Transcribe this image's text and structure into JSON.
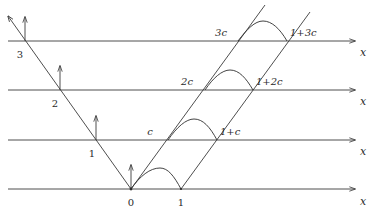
{
  "diagram": {
    "type": "space-time characteristics diagram",
    "colors": {
      "stroke": "#3a3a3a",
      "text": "#2a2a2a",
      "background": "#ffffff"
    },
    "time_lines": [
      {
        "index": 0,
        "y": 189,
        "left_label": "0",
        "left_label_pos": [
          131,
          205
        ],
        "axis_label": "x"
      },
      {
        "index": 1,
        "y": 140,
        "left_label": "1",
        "left_label_pos": [
          92,
          157
        ],
        "axis_label": "x",
        "c_label": "c",
        "c_label_pos": [
          150,
          135
        ],
        "right_label": "1+c",
        "right_label_pos": [
          221,
          135
        ]
      },
      {
        "index": 2,
        "y": 90,
        "left_label": "2",
        "left_label_pos": [
          55,
          107
        ],
        "axis_label": "x",
        "c_label": "2c",
        "c_label_pos": [
          185,
          85
        ],
        "right_label": "1+2c",
        "right_label_pos": [
          256,
          85
        ]
      },
      {
        "index": 3,
        "y": 41,
        "left_label": "3",
        "left_label_pos": [
          20,
          58
        ],
        "axis_label": "x",
        "c_label": "3c",
        "c_label_pos": [
          218,
          36
        ],
        "right_label": "1+3c",
        "right_label_pos": [
          290,
          36
        ]
      }
    ],
    "bottom_labels": {
      "zero": "0",
      "one": "1",
      "zero_pos": [
        131,
        205
      ],
      "one_pos": [
        181,
        205
      ]
    },
    "axis_label_text": "x",
    "axis_label_x": 362
  }
}
